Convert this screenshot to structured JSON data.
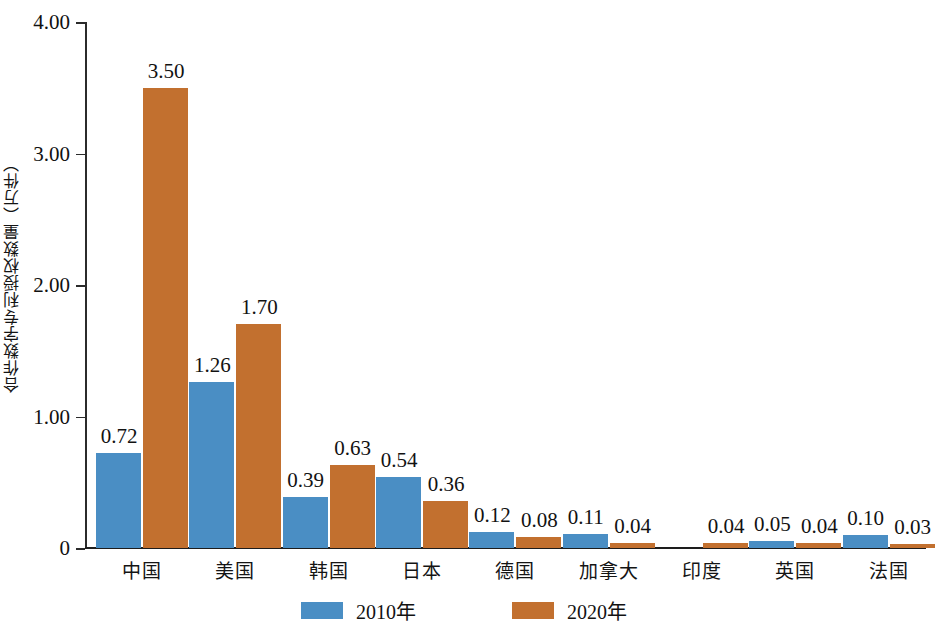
{
  "chart_data": {
    "type": "bar",
    "title": "",
    "xlabel": "",
    "ylabel": "合作数字专利授权数量（万件）",
    "ylim": [
      0,
      4.0
    ],
    "yticks": [
      "0",
      "1.00",
      "2.00",
      "3.00",
      "4.00"
    ],
    "ytick_values": [
      0,
      1.0,
      2.0,
      3.0,
      4.0
    ],
    "grid": false,
    "legend_position": "bottom-center",
    "categories": [
      "中国",
      "美国",
      "韩国",
      "日本",
      "德国",
      "加拿大",
      "印度",
      "英国",
      "法国"
    ],
    "series": [
      {
        "name": "2010年",
        "color": "#4a8ec4",
        "values": [
          0.72,
          1.26,
          0.39,
          0.54,
          0.12,
          0.11,
          null,
          0.05,
          0.1
        ],
        "labels": [
          "0.72",
          "1.26",
          "0.39",
          "0.54",
          "0.12",
          "0.11",
          "",
          "0.05",
          "0.10"
        ]
      },
      {
        "name": "2020年",
        "color": "#c2702f",
        "values": [
          3.5,
          1.7,
          0.63,
          0.36,
          0.08,
          0.04,
          0.04,
          0.04,
          0.03
        ],
        "labels": [
          "3.50",
          "1.70",
          "0.63",
          "0.36",
          "0.08",
          "0.04",
          "0.04",
          "0.04",
          "0.03"
        ]
      }
    ]
  },
  "legend": {
    "items": [
      {
        "label": "2010年",
        "color": "#4a8ec4"
      },
      {
        "label": "2020年",
        "color": "#c2702f"
      }
    ]
  }
}
